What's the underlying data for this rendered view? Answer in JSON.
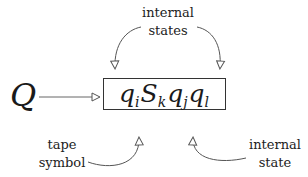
{
  "diagram": {
    "input_symbol": "Q",
    "configuration": [
      {
        "base": "q",
        "sub": "i"
      },
      {
        "base": "S",
        "sub": "k"
      },
      {
        "base": "q",
        "sub": "j"
      },
      {
        "base": "q",
        "sub": "l"
      }
    ],
    "labels": {
      "top_line1": "internal",
      "top_line2": "states",
      "bottom_left_line1": "tape",
      "bottom_left_line2": "symbol",
      "bottom_right_line1": "internal",
      "bottom_right_line2": "state"
    },
    "colors": {
      "ink": "#222222",
      "arrow": "#555555",
      "background": "#ffffff"
    }
  }
}
